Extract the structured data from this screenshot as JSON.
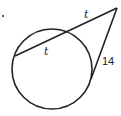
{
  "problem": {
    "marker": "."
  },
  "diagram": {
    "circle": {
      "cx": 52,
      "cy": 69,
      "r": 40
    },
    "external_point": {
      "x": 117,
      "y": 8
    },
    "secant": {
      "near_point": {
        "x": 68,
        "y": 31
      },
      "far_point": {
        "x": 15,
        "y": 56
      }
    },
    "tangent_point": {
      "x": 92,
      "y": 76
    },
    "labels": {
      "external_segment": "t",
      "internal_chord": "t",
      "tangent": "14"
    },
    "stroke_color": "#222222"
  }
}
